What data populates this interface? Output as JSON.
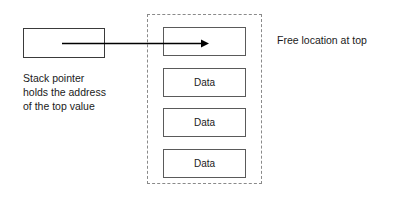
{
  "diagram": {
    "background_color": "#ffffff",
    "text_color": "#1a1a1a"
  },
  "stack_pointer": {
    "box_label": "",
    "box_border_color": "#3a3a3a",
    "caption_lines": [
      "Stack pointer",
      "holds the address",
      "of the top value"
    ]
  },
  "arrow": {
    "name": "pointer-arrow",
    "color": "#000000",
    "direction": "right",
    "description": "Arrow from stack pointer box to top free stack location"
  },
  "memory_region": {
    "border_style": "dashed",
    "border_color": "#8a8a8a",
    "cells": [
      {
        "label": "",
        "role": "free-location"
      },
      {
        "label": "Data",
        "role": "data"
      },
      {
        "label": "Data",
        "role": "data"
      },
      {
        "label": "Data",
        "role": "data"
      }
    ],
    "cell_border_color": "#5a5a5a"
  },
  "annotations": {
    "free_location_note": "Free location at top"
  }
}
